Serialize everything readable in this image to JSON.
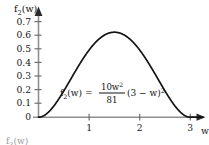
{
  "figure": {
    "background_color": "#ffffff",
    "curve_color": "#141414",
    "axis_color": "#8a8a8a",
    "text_color": "#161616"
  },
  "axis_labels": {
    "y_name": "f",
    "y_name_sub": "2",
    "y_name_tail": "(w)",
    "x_name": "w"
  },
  "formula": {
    "lhs": "f",
    "lhs_sub": "2",
    "lhs_tail": "(w) =",
    "numerator": "10w",
    "numerator_sup": "2",
    "denominator": "81",
    "rhs": "(3 − w)",
    "rhs_sup": "2",
    "plain": "f2(w) = (10w^2 / 81) (3 − w)^2"
  },
  "next_figure_label": {
    "name": "f",
    "sub": "3",
    "tail": "(w)"
  },
  "chart_data": {
    "type": "line",
    "title": "",
    "subtitle": "",
    "xlabel": "w",
    "ylabel": "f2(w)",
    "annotations": [
      "f2(w) = (10w^2/81)(3 - w)^2"
    ],
    "grid": false,
    "legend_position": "none",
    "xlim": [
      0,
      3.25
    ],
    "ylim": [
      0,
      0.75
    ],
    "xticks": [
      1,
      2,
      3
    ],
    "xtick_labels": [
      "1",
      "2",
      "3"
    ],
    "yticks": [
      0,
      0.1,
      0.2,
      0.3,
      0.4,
      0.5,
      0.6,
      0.7
    ],
    "ytick_labels": [
      "0",
      "0.1",
      "0.2",
      "0.3",
      "0.4",
      "0.5",
      "0.6",
      "0.7"
    ],
    "origin_label": "0",
    "peak": {
      "x": 1.5,
      "y": 0.625
    },
    "series": [
      {
        "name": "f2(w)",
        "color": "#141414",
        "x": [
          0,
          0.1,
          0.2,
          0.3,
          0.4,
          0.5,
          0.6,
          0.7,
          0.8,
          0.9,
          1.0,
          1.1,
          1.2,
          1.3,
          1.4,
          1.5,
          1.6,
          1.7,
          1.8,
          1.9,
          2.0,
          2.1,
          2.2,
          2.3,
          2.4,
          2.5,
          2.6,
          2.7,
          2.8,
          2.9,
          3.0
        ],
        "y": [
          0.0,
          0.0011,
          0.0043,
          0.0094,
          0.0161,
          0.0241,
          0.0331,
          0.0428,
          0.0528,
          0.0627,
          0.0723,
          0.0812,
          0.0891,
          0.0958,
          0.1011,
          0.1049,
          0.1069,
          0.1072,
          0.1058,
          0.1027,
          0.0981,
          0.0921,
          0.0849,
          0.0768,
          0.068,
          0.0588,
          0.0494,
          0.0401,
          0.0312,
          0.023,
          0.0
        ],
        "y_scaled_note": "values plotted are 10w^2(3-w)^2/81"
      }
    ]
  }
}
